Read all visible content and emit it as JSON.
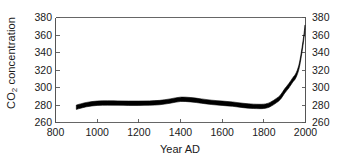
{
  "chart_data": {
    "type": "area",
    "title": "",
    "xlabel": "Year AD",
    "ylabel": "CO2 concentration",
    "ylabel_html": "CO<sub>2</sub> concentration",
    "xlim": [
      800,
      2000
    ],
    "ylim": [
      260,
      380
    ],
    "xticks": [
      800,
      1000,
      1200,
      1400,
      1600,
      1800,
      2000
    ],
    "yticks": [
      260,
      280,
      300,
      320,
      340,
      360,
      380
    ],
    "xtick_labels": [
      "800",
      "1000",
      "1200",
      "1400",
      "1600",
      "1800",
      "2000"
    ],
    "ytick_labels_left": [
      "260",
      "280",
      "300",
      "320",
      "340",
      "360",
      "380"
    ],
    "ytick_labels_right": [
      "260",
      "280",
      "300",
      "320",
      "340",
      "360",
      "380"
    ],
    "grid": false,
    "legend": null,
    "legend_position": "none",
    "mirrored_y_axis": true,
    "series": [
      {
        "name": "CO2 concentration",
        "style": "uncertainty-band",
        "color": "#000000",
        "x": [
          900,
          950,
          1000,
          1050,
          1100,
          1150,
          1200,
          1250,
          1300,
          1350,
          1400,
          1450,
          1500,
          1550,
          1600,
          1650,
          1700,
          1750,
          1800,
          1830,
          1860,
          1880,
          1900,
          1920,
          1940,
          1950,
          1960,
          1970,
          1980,
          1990,
          1998
        ],
        "values": [
          277.5,
          280.5,
          282.0,
          282.3,
          282.2,
          282.0,
          282.0,
          282.2,
          282.8,
          284.5,
          286.5,
          286.0,
          284.5,
          283.0,
          282.0,
          281.0,
          279.5,
          278.5,
          278.5,
          280.5,
          285.0,
          289.0,
          296.0,
          302.0,
          309.0,
          312.0,
          317.0,
          325.0,
          338.0,
          354.0,
          369.0
        ],
        "band_upper": [
          280.0,
          283.0,
          284.5,
          284.8,
          284.7,
          284.5,
          284.5,
          284.7,
          285.3,
          287.0,
          289.0,
          288.5,
          287.0,
          285.5,
          284.5,
          283.5,
          282.0,
          281.0,
          281.0,
          283.0,
          287.5,
          291.5,
          298.5,
          304.5,
          311.5,
          314.5,
          319.5,
          327.5,
          340.5,
          356.5,
          371.5
        ],
        "band_lower": [
          275.0,
          278.0,
          279.5,
          279.8,
          279.7,
          279.5,
          279.5,
          279.7,
          280.3,
          282.0,
          284.0,
          283.5,
          282.0,
          280.5,
          279.5,
          278.5,
          277.0,
          276.0,
          276.0,
          278.0,
          282.5,
          286.5,
          293.5,
          299.5,
          306.5,
          309.5,
          314.5,
          322.5,
          335.5,
          351.5,
          366.5
        ]
      }
    ],
    "axis_color": "#555555",
    "background": "#ffffff",
    "units": "ppm"
  }
}
